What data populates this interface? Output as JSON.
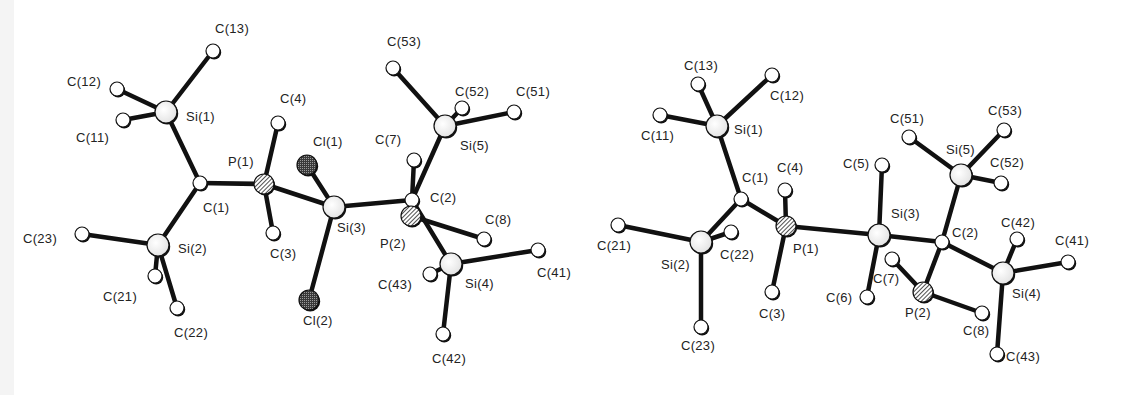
{
  "figure": {
    "panels": [
      {
        "id": "left",
        "atoms": [
          {
            "label": "C(13)",
            "x": 213,
            "y": 51,
            "type": "C",
            "lx": 215,
            "ly": 33
          },
          {
            "label": "C(12)",
            "x": 117,
            "y": 89,
            "type": "C",
            "lx": 67,
            "ly": 86
          },
          {
            "label": "Si(1)",
            "x": 166,
            "y": 112,
            "type": "Si",
            "lx": 186,
            "ly": 121
          },
          {
            "label": "C(11)",
            "x": 123,
            "y": 120,
            "type": "C",
            "lx": 76,
            "ly": 142
          },
          {
            "label": "C(4)",
            "x": 278,
            "y": 123,
            "type": "C",
            "lx": 280,
            "ly": 103
          },
          {
            "label": "P(1)",
            "x": 264,
            "y": 184,
            "type": "P",
            "lx": 228,
            "ly": 166
          },
          {
            "label": "C(1)",
            "x": 200,
            "y": 183,
            "type": "C",
            "lx": 203,
            "ly": 212
          },
          {
            "label": "C(3)",
            "x": 273,
            "y": 233,
            "type": "C",
            "lx": 270,
            "ly": 258
          },
          {
            "label": "Cl(1)",
            "x": 307,
            "y": 165,
            "type": "Cl",
            "lx": 313,
            "ly": 146
          },
          {
            "label": "Si(3)",
            "x": 334,
            "y": 207,
            "type": "Si",
            "lx": 337,
            "ly": 232
          },
          {
            "label": "Cl(2)",
            "x": 309,
            "y": 300,
            "type": "Cl",
            "lx": 303,
            "ly": 325
          },
          {
            "label": "C(23)",
            "x": 82,
            "y": 234,
            "type": "C",
            "lx": 23,
            "ly": 243
          },
          {
            "label": "Si(2)",
            "x": 158,
            "y": 245,
            "type": "Si",
            "lx": 178,
            "ly": 253
          },
          {
            "label": "C(21)",
            "x": 155,
            "y": 276,
            "type": "C",
            "lx": 103,
            "ly": 301
          },
          {
            "label": "C(22)",
            "x": 177,
            "y": 308,
            "type": "C",
            "lx": 174,
            "ly": 337
          },
          {
            "label": "C(53)",
            "x": 393,
            "y": 68,
            "type": "C",
            "lx": 387,
            "ly": 46
          },
          {
            "label": "C(52)",
            "x": 462,
            "y": 108,
            "type": "C",
            "lx": 455,
            "ly": 96
          },
          {
            "label": "C(51)",
            "x": 514,
            "y": 112,
            "type": "C",
            "lx": 516,
            "ly": 96
          },
          {
            "label": "Si(5)",
            "x": 445,
            "y": 126,
            "type": "Si",
            "lx": 460,
            "ly": 150
          },
          {
            "label": "C(7)",
            "x": 414,
            "y": 160,
            "type": "C",
            "lx": 375,
            "ly": 144
          },
          {
            "label": "C(2)",
            "x": 412,
            "y": 200,
            "type": "C",
            "lx": 430,
            "ly": 202
          },
          {
            "label": "P(2)",
            "x": 411,
            "y": 216,
            "type": "P",
            "lx": 380,
            "ly": 248
          },
          {
            "label": "C(8)",
            "x": 484,
            "y": 239,
            "type": "C",
            "lx": 485,
            "ly": 224
          },
          {
            "label": "C(41)",
            "x": 538,
            "y": 250,
            "type": "C",
            "lx": 537,
            "ly": 277
          },
          {
            "label": "Si(4)",
            "x": 451,
            "y": 264,
            "type": "Si",
            "lx": 465,
            "ly": 288
          },
          {
            "label": "C(43)",
            "x": 430,
            "y": 274,
            "type": "C",
            "lx": 378,
            "ly": 289
          },
          {
            "label": "C(42)",
            "x": 443,
            "y": 334,
            "type": "C",
            "lx": 432,
            "ly": 363
          }
        ],
        "bonds": [
          [
            "C(13)",
            "Si(1)"
          ],
          [
            "C(12)",
            "Si(1)"
          ],
          [
            "C(11)",
            "Si(1)"
          ],
          [
            "Si(1)",
            "C(1)"
          ],
          [
            "C(1)",
            "P(1)"
          ],
          [
            "C(1)",
            "Si(2)"
          ],
          [
            "P(1)",
            "C(4)"
          ],
          [
            "P(1)",
            "C(3)"
          ],
          [
            "P(1)",
            "Si(3)"
          ],
          [
            "Si(2)",
            "C(23)"
          ],
          [
            "Si(2)",
            "C(21)"
          ],
          [
            "Si(2)",
            "C(22)"
          ],
          [
            "Si(3)",
            "Cl(1)"
          ],
          [
            "Si(3)",
            "Cl(2)"
          ],
          [
            "Si(3)",
            "C(2)"
          ],
          [
            "C(2)",
            "C(7)"
          ],
          [
            "C(2)",
            "Si(5)"
          ],
          [
            "C(2)",
            "Si(4)"
          ],
          [
            "C(2)",
            "P(2)"
          ],
          [
            "P(2)",
            "C(8)"
          ],
          [
            "Si(5)",
            "C(53)"
          ],
          [
            "Si(5)",
            "C(52)"
          ],
          [
            "Si(5)",
            "C(51)"
          ],
          [
            "Si(4)",
            "C(41)"
          ],
          [
            "Si(4)",
            "C(43)"
          ],
          [
            "Si(4)",
            "C(42)"
          ]
        ]
      },
      {
        "id": "right",
        "atoms": [
          {
            "label": "C(13)",
            "x": 698,
            "y": 84,
            "type": "C",
            "lx": 684,
            "ly": 70
          },
          {
            "label": "C(12)",
            "x": 772,
            "y": 75,
            "type": "C",
            "lx": 770,
            "ly": 100
          },
          {
            "label": "C(11)",
            "x": 660,
            "y": 115,
            "type": "C",
            "lx": 641,
            "ly": 140
          },
          {
            "label": "Si(1)",
            "x": 717,
            "y": 126,
            "type": "Si",
            "lx": 734,
            "ly": 134
          },
          {
            "label": "C(1)",
            "x": 741,
            "y": 199,
            "type": "C",
            "lx": 742,
            "ly": 182
          },
          {
            "label": "C(4)",
            "x": 785,
            "y": 190,
            "type": "C",
            "lx": 777,
            "ly": 172
          },
          {
            "label": "P(1)",
            "x": 786,
            "y": 226,
            "type": "P",
            "lx": 793,
            "ly": 253
          },
          {
            "label": "C(3)",
            "x": 772,
            "y": 292,
            "type": "C",
            "lx": 759,
            "ly": 318
          },
          {
            "label": "C(21)",
            "x": 618,
            "y": 225,
            "type": "C",
            "lx": 597,
            "ly": 250
          },
          {
            "label": "Si(2)",
            "x": 701,
            "y": 242,
            "type": "Si",
            "lx": 661,
            "ly": 269
          },
          {
            "label": "C(22)",
            "x": 731,
            "y": 232,
            "type": "C",
            "lx": 720,
            "ly": 259
          },
          {
            "label": "C(23)",
            "x": 701,
            "y": 327,
            "type": "C",
            "lx": 681,
            "ly": 350
          },
          {
            "label": "C(5)",
            "x": 882,
            "y": 165,
            "type": "C",
            "lx": 843,
            "ly": 168
          },
          {
            "label": "Si(3)",
            "x": 879,
            "y": 235,
            "type": "Si",
            "lx": 891,
            "ly": 218
          },
          {
            "label": "C(6)",
            "x": 867,
            "y": 297,
            "type": "C",
            "lx": 826,
            "ly": 302
          },
          {
            "label": "C(51)",
            "x": 909,
            "y": 137,
            "type": "C",
            "lx": 890,
            "ly": 123
          },
          {
            "label": "C(53)",
            "x": 1004,
            "y": 130,
            "type": "C",
            "lx": 988,
            "ly": 115
          },
          {
            "label": "Si(5)",
            "x": 961,
            "y": 175,
            "type": "Si",
            "lx": 946,
            "ly": 154
          },
          {
            "label": "C(52)",
            "x": 1001,
            "y": 183,
            "type": "C",
            "lx": 990,
            "ly": 167
          },
          {
            "label": "C(2)",
            "x": 942,
            "y": 242,
            "type": "C",
            "lx": 952,
            "ly": 237
          },
          {
            "label": "C(42)",
            "x": 1017,
            "y": 239,
            "type": "C",
            "lx": 1001,
            "ly": 227
          },
          {
            "label": "C(41)",
            "x": 1068,
            "y": 262,
            "type": "C",
            "lx": 1055,
            "ly": 245
          },
          {
            "label": "Si(4)",
            "x": 1003,
            "y": 273,
            "type": "Si",
            "lx": 1012,
            "ly": 298
          },
          {
            "label": "C(7)",
            "x": 892,
            "y": 259,
            "type": "C",
            "lx": 873,
            "ly": 283
          },
          {
            "label": "P(2)",
            "x": 923,
            "y": 292,
            "type": "P",
            "lx": 905,
            "ly": 317
          },
          {
            "label": "C(8)",
            "x": 982,
            "y": 313,
            "type": "C",
            "lx": 963,
            "ly": 335
          },
          {
            "label": "C(43)",
            "x": 997,
            "y": 354,
            "type": "C",
            "lx": 1006,
            "ly": 361
          }
        ],
        "bonds": [
          [
            "C(13)",
            "Si(1)"
          ],
          [
            "C(12)",
            "Si(1)"
          ],
          [
            "C(11)",
            "Si(1)"
          ],
          [
            "Si(1)",
            "C(1)"
          ],
          [
            "C(1)",
            "P(1)"
          ],
          [
            "C(1)",
            "Si(2)"
          ],
          [
            "P(1)",
            "C(4)"
          ],
          [
            "P(1)",
            "C(3)"
          ],
          [
            "P(1)",
            "Si(3)"
          ],
          [
            "Si(2)",
            "C(21)"
          ],
          [
            "Si(2)",
            "C(22)"
          ],
          [
            "Si(2)",
            "C(23)"
          ],
          [
            "Si(3)",
            "C(5)"
          ],
          [
            "Si(3)",
            "C(6)"
          ],
          [
            "Si(3)",
            "C(2)"
          ],
          [
            "C(2)",
            "Si(5)"
          ],
          [
            "C(2)",
            "Si(4)"
          ],
          [
            "C(2)",
            "P(2)"
          ],
          [
            "P(2)",
            "C(7)"
          ],
          [
            "P(2)",
            "C(8)"
          ],
          [
            "Si(5)",
            "C(51)"
          ],
          [
            "Si(5)",
            "C(53)"
          ],
          [
            "Si(5)",
            "C(52)"
          ],
          [
            "Si(4)",
            "C(42)"
          ],
          [
            "Si(4)",
            "C(41)"
          ],
          [
            "Si(4)",
            "C(43)"
          ]
        ]
      }
    ],
    "styles": {
      "bond_color": "#111111",
      "atom_fill_C": "#ffffff",
      "atom_fill_Si": "#f2f2f2",
      "atom_fill_P": "#777777",
      "atom_fill_Cl": "#333333",
      "radius": {
        "C": 7,
        "Si": 11,
        "P": 10,
        "Cl": 10
      }
    }
  }
}
